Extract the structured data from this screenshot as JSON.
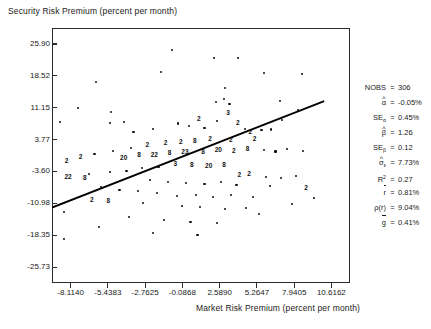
{
  "chart_data": {
    "type": "scatter",
    "title": "",
    "ylabel": "Security Risk Premium (percent per month)",
    "xlabel": "Market Risk Premium (percent per month)",
    "xticks": [
      "-8.1140",
      "-5.4383",
      "-2.7625",
      "-0.0868",
      "2.5890",
      "5.2647",
      "7.9405",
      "10.6162"
    ],
    "yticks": [
      "25.90",
      "18.52",
      "11.15",
      "3.77",
      "-3.60",
      "-10.98",
      "-18.35",
      "-25.73"
    ],
    "xlim": [
      -9.4518,
      11.9541
    ],
    "ylim": [
      -29.42,
      29.59
    ],
    "grid": false,
    "legend": "none",
    "regression_line": {
      "intercept": -0.05,
      "slope": 1.26,
      "x_start": -9.45,
      "x_end": 10.1
    },
    "points": [
      {
        "x": -7.6,
        "y": 11.0,
        "n": 1
      },
      {
        "x": -6.3,
        "y": 17.0,
        "n": 1
      },
      {
        "x": -5.2,
        "y": 10.2,
        "n": 1
      },
      {
        "x": -8.9,
        "y": 7.9,
        "n": 1
      },
      {
        "x": -5.3,
        "y": 7.6,
        "n": 1
      },
      {
        "x": -4.3,
        "y": 7.8,
        "n": 1
      },
      {
        "x": -1.6,
        "y": 19.5,
        "n": 1
      },
      {
        "x": 2.2,
        "y": 22.7,
        "n": 1
      },
      {
        "x": 3.9,
        "y": 22.6,
        "n": 1
      },
      {
        "x": 3.0,
        "y": 15.7,
        "n": 1
      },
      {
        "x": 2.9,
        "y": 13.2,
        "n": 1
      },
      {
        "x": 3.3,
        "y": 12.1,
        "n": 1
      },
      {
        "x": 2.3,
        "y": 12.5,
        "n": 1
      },
      {
        "x": 3.2,
        "y": 10.0,
        "n": 3
      },
      {
        "x": 2.4,
        "y": 8.0,
        "n": 1
      },
      {
        "x": 3.9,
        "y": 7.5,
        "n": 2
      },
      {
        "x": 1.1,
        "y": 8.5,
        "n": 2
      },
      {
        "x": -0.4,
        "y": 7.5,
        "n": 1
      },
      {
        "x": 0.4,
        "y": 6.9,
        "n": 1
      },
      {
        "x": 1.5,
        "y": 6.4,
        "n": 1
      },
      {
        "x": -2.2,
        "y": 6.3,
        "n": 1
      },
      {
        "x": -3.6,
        "y": 5.6,
        "n": 1
      },
      {
        "x": 4.4,
        "y": 6.2,
        "n": 1
      },
      {
        "x": 4.8,
        "y": 5.5,
        "n": 2
      },
      {
        "x": 5.6,
        "y": 5.9,
        "n": 1
      },
      {
        "x": 6.3,
        "y": 6.1,
        "n": 1
      },
      {
        "x": 7.1,
        "y": 8.3,
        "n": 1
      },
      {
        "x": 8.2,
        "y": 10.7,
        "n": 1
      },
      {
        "x": 6.9,
        "y": 12.6,
        "n": 1
      },
      {
        "x": 5.1,
        "y": 3.9,
        "n": 2
      },
      {
        "x": 3.4,
        "y": 3.6,
        "n": 2
      },
      {
        "x": 1.9,
        "y": 3.8,
        "n": 2
      },
      {
        "x": 0.8,
        "y": 3.4,
        "n": 8
      },
      {
        "x": -0.2,
        "y": 3.1,
        "n": 2
      },
      {
        "x": -1.3,
        "y": 2.9,
        "n": 2
      },
      {
        "x": -2.6,
        "y": 2.5,
        "n": 2
      },
      {
        "x": -3.8,
        "y": 1.8,
        "n": 1
      },
      {
        "x": -5.1,
        "y": 1.2,
        "n": 1
      },
      {
        "x": -6.4,
        "y": 0.4,
        "n": 1
      },
      {
        "x": -7.4,
        "y": -0.3,
        "n": 2
      },
      {
        "x": -8.4,
        "y": -1.2,
        "n": 2
      },
      {
        "x": 0.1,
        "y": 0.9,
        "n": 23
      },
      {
        "x": 1.4,
        "y": 1.0,
        "n": 8
      },
      {
        "x": 2.5,
        "y": 1.3,
        "n": 20
      },
      {
        "x": 3.6,
        "y": 1.1,
        "n": 2
      },
      {
        "x": 4.6,
        "y": 1.5,
        "n": 8
      },
      {
        "x": -1.0,
        "y": 0.7,
        "n": 8
      },
      {
        "x": -2.1,
        "y": 0.3,
        "n": 22
      },
      {
        "x": -3.2,
        "y": 0.1,
        "n": 8
      },
      {
        "x": -4.3,
        "y": -0.4,
        "n": 20
      },
      {
        "x": 5.8,
        "y": 1.4,
        "n": 1
      },
      {
        "x": 6.6,
        "y": 1.0,
        "n": 1
      },
      {
        "x": 7.4,
        "y": 1.6,
        "n": 1
      },
      {
        "x": 8.6,
        "y": 1.2,
        "n": 1
      },
      {
        "x": -0.6,
        "y": -1.9,
        "n": 3
      },
      {
        "x": 0.6,
        "y": -2.1,
        "n": 8
      },
      {
        "x": 1.8,
        "y": -2.3,
        "n": 20
      },
      {
        "x": 2.9,
        "y": -2.0,
        "n": 8
      },
      {
        "x": -1.8,
        "y": -2.6,
        "n": 1
      },
      {
        "x": -3.0,
        "y": -2.9,
        "n": 1
      },
      {
        "x": -4.1,
        "y": -3.4,
        "n": 1
      },
      {
        "x": -5.3,
        "y": -3.8,
        "n": 1
      },
      {
        "x": -6.8,
        "y": -4.1,
        "n": 1
      },
      {
        "x": -8.3,
        "y": -4.9,
        "n": 22
      },
      {
        "x": -7.1,
        "y": -5.2,
        "n": 8
      },
      {
        "x": 4.0,
        "y": -4.5,
        "n": 2
      },
      {
        "x": 4.7,
        "y": -4.2,
        "n": 2
      },
      {
        "x": 5.9,
        "y": -4.8,
        "n": 1
      },
      {
        "x": 7.0,
        "y": -5.1,
        "n": 1
      },
      {
        "x": 8.1,
        "y": -4.6,
        "n": 1
      },
      {
        "x": -2.4,
        "y": -5.6,
        "n": 1
      },
      {
        "x": -1.1,
        "y": -6.0,
        "n": 1
      },
      {
        "x": 0.2,
        "y": -6.3,
        "n": 1
      },
      {
        "x": 1.5,
        "y": -6.5,
        "n": 1
      },
      {
        "x": 2.7,
        "y": -6.1,
        "n": 1
      },
      {
        "x": 3.8,
        "y": -6.8,
        "n": 1
      },
      {
        "x": 6.2,
        "y": -7.0,
        "n": 1
      },
      {
        "x": 8.8,
        "y": -7.4,
        "n": 2
      },
      {
        "x": -5.9,
        "y": -7.2,
        "n": 1
      },
      {
        "x": -4.6,
        "y": -7.8,
        "n": 1
      },
      {
        "x": -3.3,
        "y": -8.2,
        "n": 1
      },
      {
        "x": -1.9,
        "y": -8.6,
        "n": 1
      },
      {
        "x": -0.5,
        "y": -9.2,
        "n": 1
      },
      {
        "x": 0.9,
        "y": -9.0,
        "n": 1
      },
      {
        "x": 2.1,
        "y": -9.5,
        "n": 1
      },
      {
        "x": 3.4,
        "y": -9.1,
        "n": 1
      },
      {
        "x": 5.0,
        "y": -9.6,
        "n": 1
      },
      {
        "x": -6.6,
        "y": -10.1,
        "n": 2
      },
      {
        "x": -5.4,
        "y": -10.4,
        "n": 8
      },
      {
        "x": -2.9,
        "y": -11.0,
        "n": 1
      },
      {
        "x": -0.1,
        "y": -11.5,
        "n": 1
      },
      {
        "x": 1.2,
        "y": -11.8,
        "n": 1
      },
      {
        "x": 3.0,
        "y": -12.3,
        "n": 1
      },
      {
        "x": 4.5,
        "y": -12.0,
        "n": 1
      },
      {
        "x": -8.6,
        "y": -13.0,
        "n": 1
      },
      {
        "x": -8.6,
        "y": -19.3,
        "n": 1
      },
      {
        "x": -3.9,
        "y": -14.2,
        "n": 1
      },
      {
        "x": -1.4,
        "y": -14.8,
        "n": 1
      },
      {
        "x": 0.5,
        "y": -15.2,
        "n": 1
      },
      {
        "x": 2.4,
        "y": -15.6,
        "n": 1
      },
      {
        "x": -6.1,
        "y": -16.5,
        "n": 1
      },
      {
        "x": -2.2,
        "y": -17.8,
        "n": 1
      },
      {
        "x": 1.0,
        "y": -18.4,
        "n": 1
      },
      {
        "x": 5.4,
        "y": -13.5,
        "n": 1
      },
      {
        "x": 7.8,
        "y": -11.2,
        "n": 1
      },
      {
        "x": 9.4,
        "y": -9.8,
        "n": 1
      },
      {
        "x": -0.8,
        "y": 24.5,
        "n": 1
      },
      {
        "x": 5.8,
        "y": 19.1,
        "n": 1
      },
      {
        "x": 8.5,
        "y": 18.9,
        "n": 1
      }
    ]
  },
  "stats": {
    "rows": [
      {
        "symbol": "NOBS",
        "hat": "",
        "sub": "",
        "sup": "",
        "bar": false,
        "eq": "=",
        "value": "306"
      },
      {
        "symbol": "α",
        "hat": "^",
        "sub": "",
        "sup": "",
        "bar": false,
        "eq": "=",
        "value": "-0.05%"
      },
      {
        "symbol": "SE",
        "hat": "",
        "sub": "α",
        "sup": "",
        "bar": false,
        "eq": "=",
        "value": "0.45%"
      },
      {
        "symbol": "β",
        "hat": "^",
        "sub": "",
        "sup": "",
        "bar": false,
        "eq": "=",
        "value": "1.26"
      },
      {
        "symbol": "SE",
        "hat": "",
        "sub": "β",
        "sup": "",
        "bar": false,
        "eq": "=",
        "value": "0.12"
      },
      {
        "symbol": "σ",
        "hat": "^",
        "sub": "ε",
        "sup": "",
        "bar": false,
        "eq": "=",
        "value": "7.73%"
      },
      {
        "symbol": "R",
        "hat": "",
        "sub": "",
        "sup": "2",
        "bar": false,
        "eq": "=",
        "value": "0.27"
      },
      {
        "symbol": "r",
        "hat": "",
        "sub": "",
        "sup": "",
        "bar": true,
        "eq": "=",
        "value": "0.81%"
      },
      {
        "symbol": "ρ(r)",
        "hat": "",
        "sub": "",
        "sup": "",
        "bar": false,
        "eq": "=",
        "value": "9.04%"
      },
      {
        "symbol": "g",
        "hat": "",
        "sub": "",
        "sup": "",
        "bar": true,
        "eq": "=",
        "value": "0.41%"
      }
    ]
  },
  "colors": {
    "point": "#111111",
    "line": "#000000",
    "frame": "#2b2b2b",
    "text": "#1a1a1a",
    "background": "#ffffff"
  }
}
